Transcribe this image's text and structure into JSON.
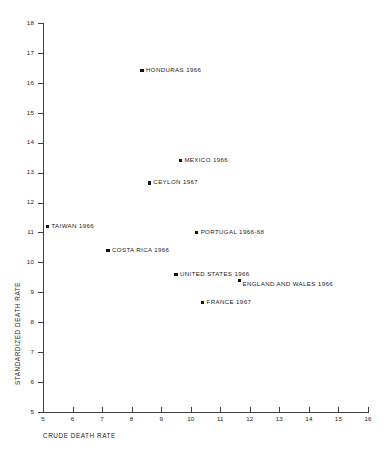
{
  "figure": {
    "background": "#ffffff",
    "marker_color": "#111111",
    "axis_color": "#3d3d3d"
  },
  "chart_data": {
    "type": "scatter",
    "title": "",
    "xlabel": "CRUDE DEATH RATE",
    "ylabel": "STANDARDIZED DEATH RATE",
    "xlim": [
      5,
      16
    ],
    "ylim": [
      5,
      18
    ],
    "xticks": [
      5,
      6,
      7,
      8,
      9,
      10,
      11,
      12,
      13,
      14,
      15,
      16
    ],
    "yticks": [
      5,
      6,
      7,
      8,
      9,
      10,
      11,
      12,
      13,
      14,
      15,
      16,
      17,
      18
    ],
    "xtick_labels": [
      "5",
      "6",
      "7",
      "8",
      "9",
      "10",
      "11",
      "12",
      "13",
      "14",
      "15",
      "16"
    ],
    "ytick_labels": [
      "5",
      "6",
      "7",
      "8",
      "9",
      "10",
      "11",
      "12",
      "13",
      "14",
      "15",
      "16",
      "17",
      "18"
    ],
    "grid": false,
    "legend": "none",
    "points": [
      {
        "label": "HONDURAS 1966",
        "x": 8.35,
        "y": 16.4,
        "label_pos": "right"
      },
      {
        "label": "MEXICO 1966",
        "x": 9.65,
        "y": 13.4,
        "label_pos": "right"
      },
      {
        "label": "CEYLON 1967",
        "x": 8.6,
        "y": 12.65,
        "label_pos": "right"
      },
      {
        "label": "TAIWAN 1966",
        "x": 5.15,
        "y": 11.2,
        "label_pos": "right"
      },
      {
        "label": "PORTUGAL 1966-68",
        "x": 10.2,
        "y": 11.0,
        "label_pos": "right"
      },
      {
        "label": "COSTA RICA 1966",
        "x": 7.2,
        "y": 10.4,
        "label_pos": "right"
      },
      {
        "label": "UNITED STATES 1966",
        "x": 9.5,
        "y": 9.6,
        "label_pos": "right"
      },
      {
        "label": "ENGLAND AND WALES 1966",
        "x": 11.65,
        "y": 9.4,
        "label_pos": "below"
      },
      {
        "label": "FRANCE 1967",
        "x": 10.4,
        "y": 8.65,
        "label_pos": "right"
      }
    ]
  }
}
